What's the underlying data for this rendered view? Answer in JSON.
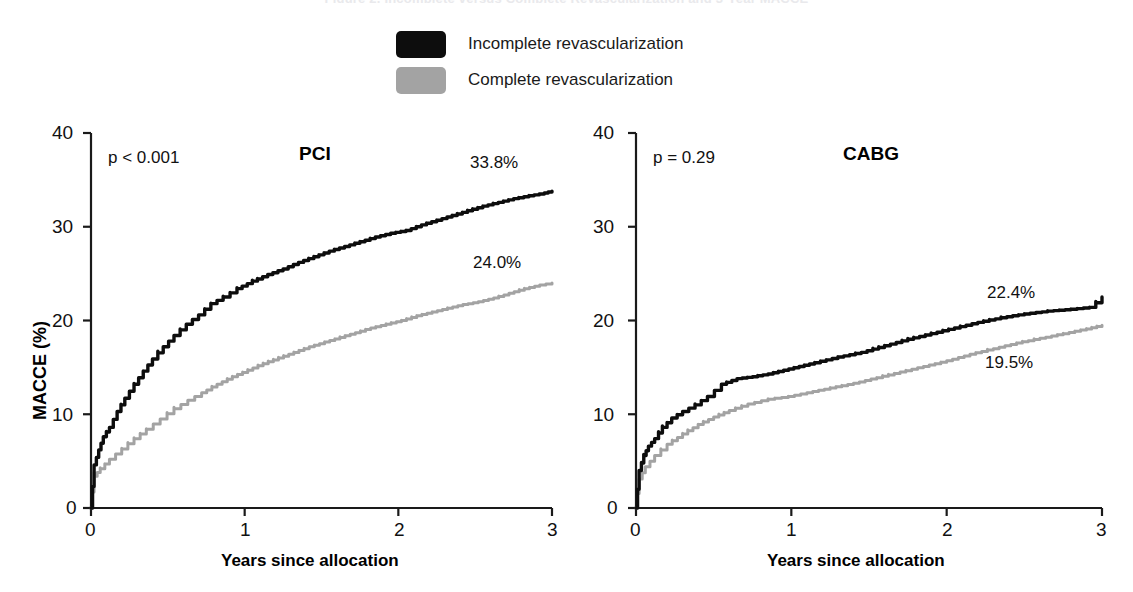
{
  "figure": {
    "title": "Figure 2. Incomplete versus Complete Revascularization and 3-Year MACCE"
  },
  "legend": {
    "items": [
      {
        "label": "Incomplete revascularization",
        "color": "#0d0d0d",
        "swatch_name": "legend-swatch-incomplete"
      },
      {
        "label": "Complete revascularization",
        "color": "#a3a3a3",
        "swatch_name": "legend-swatch-complete"
      }
    ]
  },
  "axes": {
    "ylabel": "MACCE (%)",
    "xlabel": "Years since allocation",
    "yticks": [
      "0",
      "10",
      "20",
      "30",
      "40"
    ],
    "xticks": [
      "0",
      "1",
      "2",
      "3"
    ]
  },
  "panels": [
    {
      "name": "PCI",
      "pvalue": "p < 0.001",
      "endlabels": {
        "incomplete": "33.8%",
        "complete": "24.0%"
      }
    },
    {
      "name": "CABG",
      "pvalue": "p = 0.29",
      "endlabels": {
        "incomplete": "22.4%",
        "complete": "19.5%"
      }
    }
  ],
  "chart_data": {
    "type": "line",
    "title": "Incomplete versus Complete Revascularization and 3-Year MACCE",
    "xlabel": "Years since allocation",
    "ylabel": "MACCE (%)",
    "xlim": [
      0,
      3
    ],
    "ylim": [
      0,
      40
    ],
    "xticks": [
      0,
      1,
      2,
      3
    ],
    "yticks": [
      0,
      10,
      20,
      30,
      40
    ],
    "grid": false,
    "legend_position": "top-center",
    "panels": [
      {
        "name": "PCI",
        "annotation": "p < 0.001",
        "series": [
          {
            "name": "Incomplete revascularization",
            "color": "#0d0d0d",
            "final_label": "33.8%",
            "final_value": 33.8,
            "x": [
              0,
              0.02,
              0.05,
              0.08,
              0.12,
              0.17,
              0.22,
              0.28,
              0.34,
              0.4,
              0.47,
              0.54,
              0.62,
              0.7,
              0.78,
              0.86,
              0.95,
              1.05,
              1.15,
              1.25,
              1.35,
              1.45,
              1.55,
              1.65,
              1.75,
              1.85,
              1.95,
              2.05,
              2.15,
              2.25,
              2.35,
              2.45,
              2.55,
              2.65,
              2.75,
              2.85,
              2.95,
              3.0
            ],
            "y": [
              0,
              4.6,
              6.2,
              7.6,
              8.6,
              10.3,
              11.7,
              13.2,
              14.6,
              15.9,
              17.2,
              18.4,
              19.6,
              20.6,
              21.8,
              22.5,
              23.4,
              24.2,
              24.9,
              25.5,
              26.2,
              26.8,
              27.4,
              27.9,
              28.4,
              28.9,
              29.3,
              29.6,
              30.2,
              30.7,
              31.2,
              31.7,
              32.2,
              32.6,
              33.0,
              33.3,
              33.6,
              33.8
            ]
          },
          {
            "name": "Complete revascularization",
            "color": "#a3a3a3",
            "final_label": "24.0%",
            "final_value": 24.0,
            "x": [
              0,
              0.02,
              0.06,
              0.12,
              0.2,
              0.28,
              0.36,
              0.45,
              0.54,
              0.63,
              0.72,
              0.82,
              0.92,
              1.02,
              1.12,
              1.22,
              1.32,
              1.42,
              1.52,
              1.62,
              1.72,
              1.82,
              1.92,
              2.02,
              2.12,
              2.22,
              2.32,
              2.42,
              2.52,
              2.62,
              2.72,
              2.82,
              2.92,
              3.0
            ],
            "y": [
              0,
              3.4,
              4.2,
              5.2,
              6.3,
              7.4,
              8.4,
              9.5,
              10.6,
              11.5,
              12.3,
              13.2,
              14.0,
              14.7,
              15.4,
              16.0,
              16.6,
              17.2,
              17.7,
              18.2,
              18.7,
              19.2,
              19.6,
              20.0,
              20.5,
              20.9,
              21.3,
              21.7,
              22.0,
              22.4,
              22.9,
              23.4,
              23.8,
              24.0
            ]
          }
        ]
      },
      {
        "name": "CABG",
        "annotation": "p = 0.29",
        "series": [
          {
            "name": "Incomplete revascularization",
            "color": "#0d0d0d",
            "final_label": "22.4%",
            "final_value": 22.4,
            "x": [
              0,
              0.02,
              0.05,
              0.08,
              0.12,
              0.17,
              0.23,
              0.3,
              0.38,
              0.46,
              0.55,
              0.65,
              0.75,
              0.85,
              0.95,
              1.05,
              1.15,
              1.3,
              1.45,
              1.6,
              1.75,
              1.9,
              2.05,
              2.2,
              2.35,
              2.5,
              2.65,
              2.8,
              2.92,
              3.0
            ],
            "y": [
              0,
              4.0,
              5.6,
              6.6,
              7.4,
              8.6,
              9.6,
              10.3,
              11.0,
              11.9,
              13.2,
              13.8,
              14.0,
              14.3,
              14.7,
              15.1,
              15.5,
              16.1,
              16.6,
              17.3,
              18.0,
              18.6,
              19.2,
              19.8,
              20.3,
              20.7,
              21.0,
              21.2,
              21.4,
              22.4
            ]
          },
          {
            "name": "Complete revascularization",
            "color": "#a3a3a3",
            "final_label": "19.5%",
            "final_value": 19.5,
            "x": [
              0,
              0.02,
              0.06,
              0.12,
              0.2,
              0.3,
              0.4,
              0.5,
              0.6,
              0.72,
              0.85,
              0.98,
              1.1,
              1.25,
              1.4,
              1.55,
              1.7,
              1.85,
              2.0,
              2.15,
              2.3,
              2.45,
              2.6,
              2.75,
              2.9,
              3.0
            ],
            "y": [
              0,
              3.1,
              4.4,
              5.6,
              6.8,
              7.9,
              8.9,
              9.7,
              10.4,
              11.1,
              11.6,
              11.9,
              12.3,
              12.8,
              13.3,
              13.9,
              14.5,
              15.1,
              15.7,
              16.4,
              17.0,
              17.6,
              18.1,
              18.6,
              19.1,
              19.5
            ]
          }
        ]
      }
    ]
  }
}
